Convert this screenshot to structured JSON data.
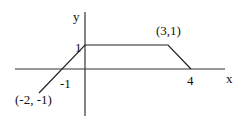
{
  "diagram": {
    "type": "piecewise-linear-graph",
    "axes": {
      "x_label": "x",
      "y_label": "y"
    },
    "tick_labels": {
      "x_neg1": "-1",
      "x_4": "4",
      "y_1": "1"
    },
    "point_labels": {
      "start": "(-2, -1)",
      "corner": "(3,1)"
    },
    "vertices": [
      {
        "x": -2,
        "y": -1
      },
      {
        "x": 0,
        "y": 1
      },
      {
        "x": 3,
        "y": 1
      },
      {
        "x": 4,
        "y": 0
      }
    ],
    "colors": {
      "line": "#222222",
      "background": "#ffffff"
    }
  }
}
